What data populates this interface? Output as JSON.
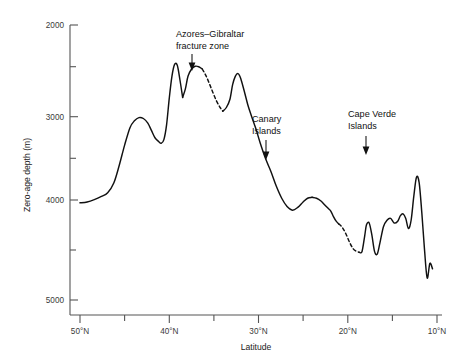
{
  "figure": {
    "background": "#ffffff",
    "curve_color": "#111111",
    "axis_color": "#555555"
  },
  "chart_data": {
    "type": "line",
    "title": "",
    "xlabel": "Latitude",
    "ylabel": "Zero-age depth (m)",
    "xlim": [
      50,
      10
    ],
    "ylim": [
      5200,
      1900
    ],
    "y_inverted": true,
    "grid": false,
    "legend": null,
    "x_ticks_major": [
      "50°N",
      "40°N",
      "30°N",
      "20°N",
      "10°N"
    ],
    "x_tick_values": [
      50,
      40,
      30,
      20,
      10
    ],
    "x_ticks_minor": [
      45,
      35,
      25,
      15
    ],
    "y_ticks_major": [
      "2000",
      "3000",
      "4000",
      "5000"
    ],
    "y_tick_values": [
      2000,
      3000,
      4000,
      5000
    ],
    "y_ticks_minor": [
      2500,
      3500,
      4500
    ],
    "series": [
      {
        "name": "Zero-age depth profile",
        "style": "solid",
        "x": [
          50.0,
          49.2,
          48.4,
          47.6,
          46.9,
          46.2,
          45.6,
          45.0,
          44.4,
          43.9,
          43.4,
          42.9,
          42.4,
          42.0,
          41.6,
          41.2,
          40.9,
          40.6,
          40.3,
          40.0,
          39.7,
          39.4,
          39.1,
          38.8,
          38.5
        ],
        "y": [
          3940,
          3930,
          3905,
          3870,
          3830,
          3720,
          3530,
          3310,
          3120,
          3045,
          3010,
          3020,
          3070,
          3150,
          3230,
          3270,
          3290,
          3250,
          3090,
          2800,
          2560,
          2430,
          2440,
          2600,
          2790
        ]
      },
      {
        "name": "Azores–Gibraltar inner peak",
        "style": "solid",
        "x": [
          38.5,
          38.2,
          37.9,
          37.5,
          37.1,
          36.7,
          36.3
        ],
        "y": [
          2790,
          2700,
          2560,
          2480,
          2450,
          2455,
          2480
        ]
      },
      {
        "name": "Azores–Gibraltar fracture zone (inferred)",
        "style": "dashed",
        "x": [
          36.3,
          35.9,
          35.5,
          35.1,
          34.7,
          34.3,
          34.0
        ],
        "y": [
          2480,
          2550,
          2640,
          2740,
          2830,
          2900,
          2940
        ]
      },
      {
        "name": "Post-fracture ridge",
        "style": "solid",
        "x": [
          34.0,
          33.6,
          33.2,
          32.9,
          32.6,
          32.3,
          32.0,
          31.6,
          31.2,
          30.8,
          30.3,
          29.8,
          29.2,
          28.6,
          28.0,
          27.4,
          26.8,
          26.2,
          25.6,
          25.0,
          24.5,
          24.0
        ],
        "y": [
          2940,
          2900,
          2810,
          2650,
          2560,
          2530,
          2580,
          2720,
          2870,
          2990,
          3130,
          3290,
          3460,
          3600,
          3760,
          3890,
          3980,
          4020,
          3990,
          3930,
          3890,
          3880
        ]
      },
      {
        "name": "Canary plateau",
        "style": "solid",
        "x": [
          24.0,
          23.5,
          23.0,
          22.6,
          22.2,
          21.9,
          21.6,
          21.3,
          21.0
        ],
        "y": [
          3880,
          3890,
          3920,
          3960,
          4000,
          4030,
          4090,
          4140,
          4170
        ]
      },
      {
        "name": "Canary–Cape Verde gap (inferred)",
        "style": "dashed",
        "x": [
          21.0,
          20.6,
          20.2,
          19.8,
          19.4,
          19.0,
          18.7
        ],
        "y": [
          4170,
          4210,
          4280,
          4370,
          4440,
          4470,
          4480
        ]
      },
      {
        "name": "Southern profile",
        "style": "solid",
        "x": [
          18.7,
          18.4,
          18.1,
          17.9,
          17.6,
          17.3,
          17.0,
          16.7,
          16.4,
          16.0,
          15.6,
          15.2,
          14.8,
          14.4,
          14.1,
          13.8,
          13.5,
          13.2,
          12.9,
          12.6,
          12.3,
          12.0,
          11.7,
          11.4,
          11.1,
          10.8,
          10.5
        ],
        "y": [
          4480,
          4470,
          4300,
          4180,
          4160,
          4290,
          4470,
          4500,
          4380,
          4200,
          4130,
          4110,
          4160,
          4140,
          4080,
          4060,
          4110,
          4220,
          4130,
          3870,
          3660,
          3720,
          4050,
          4450,
          4760,
          4600,
          4660
        ]
      }
    ],
    "annotations": [
      {
        "id": "azores-gibraltar",
        "lines": [
          "Azores–Gibraltar",
          "fracture zone"
        ],
        "target_x": 36.4,
        "target_y": 2470
      },
      {
        "id": "canary-islands",
        "lines": [
          "Canary",
          "Islands"
        ],
        "target_x": 25.7,
        "target_y": 3830
      },
      {
        "id": "cape-verde-islands",
        "lines": [
          "Cape Verde",
          "Islands"
        ],
        "target_x": 17.4,
        "target_y": 3900
      }
    ]
  }
}
